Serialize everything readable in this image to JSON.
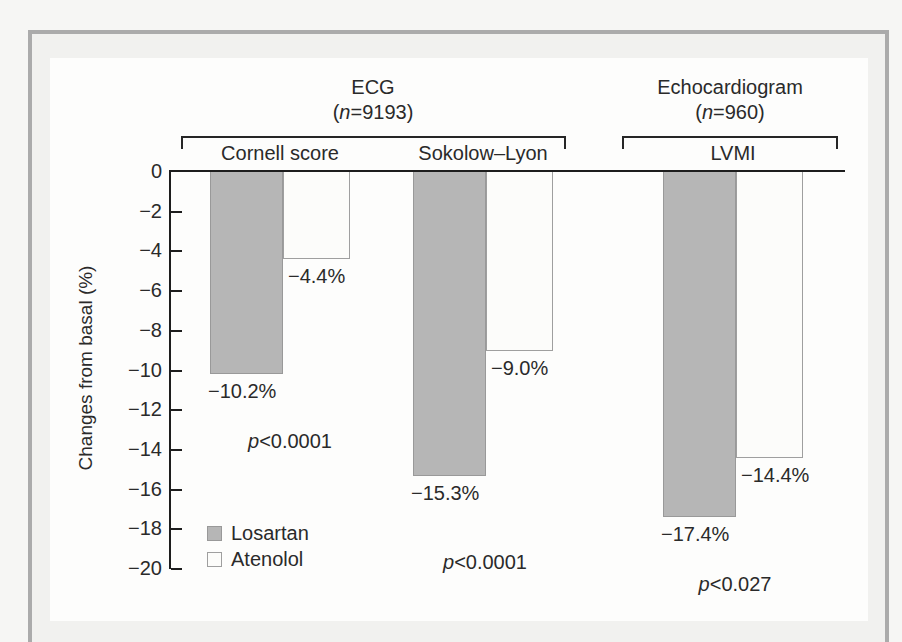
{
  "chart_data": {
    "type": "bar",
    "title": "",
    "ylabel": "Changes from basal (%)",
    "xlabel": "",
    "ylim": [
      -20,
      0
    ],
    "ytick_step": 2,
    "grid": false,
    "legend_position": "bottom-left-inside",
    "series": [
      {
        "name": "Losartan",
        "color": "#b6b6b6",
        "border_color": "#999999"
      },
      {
        "name": "Atenolol",
        "color": "#fcfcfa",
        "border_color": "#9f9f9f"
      }
    ],
    "sections": [
      {
        "title": "ECG",
        "n_label": "(n=9193)",
        "groups": [
          "Cornell score",
          "Sokolow–Lyon"
        ]
      },
      {
        "title": "Echocardiogram",
        "n_label": "(n=960)",
        "groups": [
          "LVMI"
        ]
      }
    ],
    "groups": [
      {
        "label": "Cornell score",
        "section": "ECG",
        "values": [
          -10.2,
          -4.4
        ],
        "value_labels": [
          "−10.2%",
          "−4.4%"
        ],
        "p_label": "p<0.0001"
      },
      {
        "label": "Sokolow–Lyon",
        "section": "ECG",
        "values": [
          -15.3,
          -9.0
        ],
        "value_labels": [
          "−15.3%",
          "−9.0%"
        ],
        "p_label": "p<0.0001"
      },
      {
        "label": "LVMI",
        "section": "Echocardiogram",
        "values": [
          -17.4,
          -14.4
        ],
        "value_labels": [
          "−17.4%",
          "−14.4%"
        ],
        "p_label": "p<0.027"
      }
    ],
    "colors": {
      "text": "#2a2a2a",
      "axis": "#1d1d1d",
      "frame_border": "#ababab",
      "page_inside_frame": "#f1f1ef",
      "panel": "#fdfdfc",
      "outer_background": "#f6f6f4"
    }
  }
}
